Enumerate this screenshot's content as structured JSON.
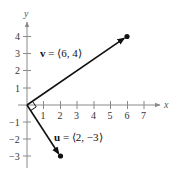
{
  "diagram": {
    "type": "vector-plot",
    "axes": {
      "x_label": "x",
      "y_label": "y",
      "x_ticks": [
        "1",
        "2",
        "3",
        "4",
        "5",
        "6",
        "7"
      ],
      "y_ticks": [
        "4",
        "3",
        "2",
        "1",
        "−1",
        "−2",
        "−3"
      ]
    },
    "vectors": [
      {
        "name": "v",
        "components": [
          6,
          4
        ],
        "label_bold": "v",
        "label_rest": " = ⟨6, 4⟩"
      },
      {
        "name": "u",
        "components": [
          2,
          -3
        ],
        "label_bold": "u",
        "label_rest": " = ⟨2, −3⟩"
      }
    ],
    "annotations": [
      "right-angle marker at origin"
    ],
    "colors": {
      "axis": "#8a8a8a",
      "vector": "#111111",
      "background": "#ffffff"
    }
  }
}
